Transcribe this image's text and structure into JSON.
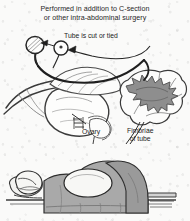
{
  "illustration": {
    "title": "Tubal ligation during C-section or other intra-abdominal surgery",
    "caption": {
      "line1": "Performed in addition to C-section",
      "line2": "or other intra-abdominal surgery"
    },
    "labels": {
      "tube_cut": "Tube is cut or tied",
      "ovary": "Ovary",
      "fimbriae_line1": "Fimbriae",
      "fimbriae_line2": "of tube"
    },
    "parts": {
      "uterus": "uterus",
      "fallopian_tube": "fallopian-tube",
      "ovary": "ovary",
      "fimbriae": "fimbriae",
      "ligature_clamp": "ligature-clamp",
      "suture_tie": "suture-tie",
      "broad_ligament": "broad-ligament"
    },
    "patient": {
      "description": "patient lying supine on operating table with surgical drape",
      "head": "head-on-pillow",
      "abdomen": "exposed-abdomen",
      "drape": "surgical-drape",
      "table": "operating-table"
    },
    "colors": {
      "paper": "#fafaf9",
      "ink": "#1c1c1c",
      "line_art": "#555555",
      "fimbriae_fill": "#8c8c8c",
      "drape_gray": "#a9a9a9",
      "drape_shadow": "#8f8f8f",
      "skin_white": "#f4f4f2",
      "table_gray": "#bdbdbd"
    }
  }
}
